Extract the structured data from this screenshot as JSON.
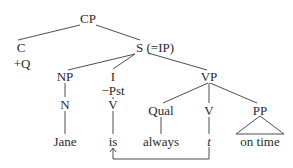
{
  "diagram": {
    "type": "syntax-tree",
    "nodes": {
      "cp": "CP",
      "c": "C",
      "c_feature": "+Q",
      "s": "S (=IP)",
      "np": "NP",
      "n": "N",
      "jane": "Jane",
      "i": "I",
      "i_feature": "−Pst",
      "v1": "V",
      "is": "is",
      "vp": "VP",
      "qual": "Qual",
      "always": "always",
      "v2": "V",
      "trace": "t",
      "pp": "PP",
      "on_time": "on time"
    },
    "edges": [
      [
        "CP",
        "C"
      ],
      [
        "CP",
        "S (=IP)"
      ],
      [
        "S (=IP)",
        "NP"
      ],
      [
        "S (=IP)",
        "I"
      ],
      [
        "S (=IP)",
        "VP"
      ],
      [
        "NP",
        "N"
      ],
      [
        "N",
        "Jane"
      ],
      [
        "I",
        "V"
      ],
      [
        "V",
        "is"
      ],
      [
        "VP",
        "Qual"
      ],
      [
        "VP",
        "V"
      ],
      [
        "VP",
        "PP"
      ],
      [
        "Qual",
        "always"
      ],
      [
        "V",
        "t"
      ],
      [
        "PP",
        "on time (triangle)"
      ]
    ],
    "movement_arrow": {
      "from": "t",
      "to": "is"
    },
    "colors": {
      "line": "#3a3a3a",
      "text": "#2a2a2a",
      "background": "#ffffff"
    }
  }
}
